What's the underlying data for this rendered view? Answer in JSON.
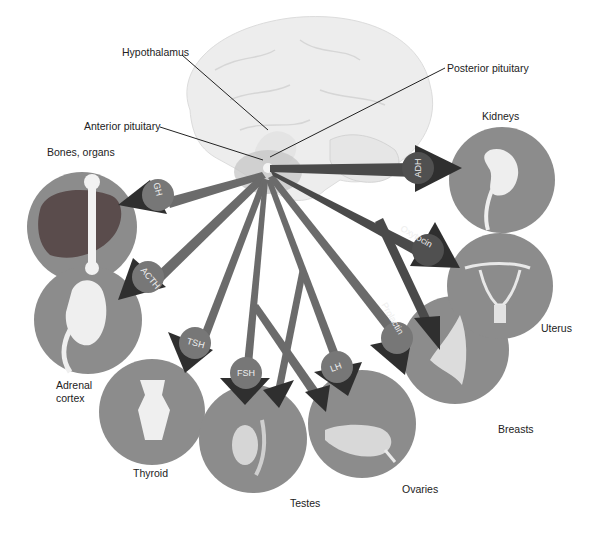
{
  "diagram": {
    "type": "pituitary hormone target diagram",
    "colors": {
      "background": "#ffffff",
      "brain": "#ededed",
      "organ_circle": "#8c8c8c",
      "anterior_arrows": "#6b6b6b",
      "posterior_arrows": "#4a4a4a",
      "arrow_heads": "#2f2f2f",
      "hormone_label_text": "#eeeeee"
    },
    "structures": {
      "hypothalamus": "Hypothalamus",
      "anterior_pituitary": "Anterior pituitary",
      "posterior_pituitary": "Posterior pituitary"
    },
    "hormones": [
      {
        "name": "GH",
        "source": "Anterior pituitary",
        "target": "Bones, organs"
      },
      {
        "name": "ACTH",
        "source": "Anterior pituitary",
        "target": "Adrenal cortex"
      },
      {
        "name": "TSH",
        "source": "Anterior pituitary",
        "target": "Thyroid"
      },
      {
        "name": "FSH",
        "source": "Anterior pituitary",
        "target": "Testes / Ovaries"
      },
      {
        "name": "LH",
        "source": "Anterior pituitary",
        "target": "Testes / Ovaries"
      },
      {
        "name": "Prolactin",
        "source": "Anterior pituitary",
        "target": "Breasts"
      },
      {
        "name": "Oxytocin",
        "source": "Posterior pituitary",
        "target": "Uterus / Breasts"
      },
      {
        "name": "ADH",
        "source": "Posterior pituitary",
        "target": "Kidneys"
      }
    ],
    "organs": {
      "bones_organs": "Bones, organs",
      "adrenal_line1": "Adrenal",
      "adrenal_line2": "cortex",
      "thyroid": "Thyroid",
      "testes": "Testes",
      "ovaries": "Ovaries",
      "breasts": "Breasts",
      "uterus": "Uterus",
      "kidneys": "Kidneys"
    }
  }
}
